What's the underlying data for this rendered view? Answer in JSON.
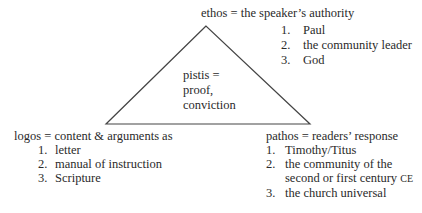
{
  "diagram": {
    "type": "rhetorical-triangle",
    "center": {
      "lines": [
        "pistis =",
        "proof,",
        "conviction"
      ]
    },
    "ethos": {
      "heading": "ethos = the speaker’s authority",
      "items": [
        {
          "num": "1.",
          "text": "Paul"
        },
        {
          "num": "2.",
          "text": "the community leader"
        },
        {
          "num": "3.",
          "text": "God"
        }
      ]
    },
    "logos": {
      "heading": "logos = content & arguments as",
      "items": [
        {
          "num": "1.",
          "text": "letter"
        },
        {
          "num": "2.",
          "text": "manual of instruction"
        },
        {
          "num": "3.",
          "text": "Scripture"
        }
      ]
    },
    "pathos": {
      "heading": "pathos = readers’ response",
      "items": [
        {
          "num": "1.",
          "text": "Timothy/Titus"
        },
        {
          "num": "2.",
          "text": "the community of the",
          "text_cont": "second or first century",
          "suffix": "CE"
        },
        {
          "num": "3.",
          "text": "the church universal"
        }
      ]
    },
    "colors": {
      "line": "#444444",
      "text": "#2a2a2a",
      "background": "#ffffff"
    }
  }
}
